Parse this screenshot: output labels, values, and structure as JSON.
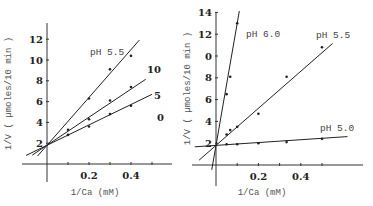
{
  "chart_data": [
    {
      "type": "scatter",
      "subtype": "lineweaver-burk",
      "title": "pH 5.5",
      "xlabel": "1/Ca (mM)",
      "ylabel": "1/V ( µmoles/10 min )",
      "xlim": [
        -0.1,
        0.55
      ],
      "ylim": [
        -1.8,
        13.5
      ],
      "xticks": [
        0.1,
        0.2,
        0.3,
        0.4,
        0.5
      ],
      "xtick_labels": [
        "",
        "0.2",
        "",
        "0.4",
        ""
      ],
      "yticks": [
        2,
        4,
        6,
        8,
        10,
        12
      ],
      "ytick_labels": [
        "2",
        "4",
        "6",
        "8",
        "10",
        "12"
      ],
      "grid": false,
      "series": [
        {
          "name": "10",
          "label": "10",
          "intercept": 1.8,
          "slope": 23.0,
          "x_line": [
            -0.045,
            0.44
          ],
          "points": [
            [
              0.1,
              3.3
            ],
            [
              0.2,
              6.3
            ],
            [
              0.3,
              9.1
            ],
            [
              0.4,
              10.4
            ]
          ]
        },
        {
          "name": "5",
          "label": "5",
          "intercept": 1.8,
          "slope": 13.5,
          "x_line": [
            -0.07,
            0.47
          ],
          "points": [
            [
              0.2,
              4.3
            ],
            [
              0.3,
              6.1
            ],
            [
              0.4,
              7.4
            ]
          ]
        },
        {
          "name": "0",
          "label": "0",
          "intercept": 1.8,
          "slope": 9.8,
          "x_line": [
            -0.1,
            0.5
          ],
          "points": [
            [
              0.1,
              2.8
            ],
            [
              0.2,
              3.6
            ],
            [
              0.3,
              4.8
            ],
            [
              0.4,
              5.6
            ]
          ]
        }
      ]
    },
    {
      "type": "scatter",
      "subtype": "lineweaver-burk",
      "title": "",
      "xlabel": "1/Ca (mM)",
      "ylabel": "1/V ( µmoles/10 min )",
      "xlim": [
        -0.1,
        0.68
      ],
      "ylim": [
        -2,
        14.5
      ],
      "xticks": [
        0.1,
        0.2,
        0.3,
        0.4,
        0.5
      ],
      "xtick_labels": [
        "",
        "0.2",
        "",
        "0.4",
        ""
      ],
      "yticks": [
        2,
        4,
        6,
        8,
        10,
        12,
        14
      ],
      "ytick_labels": [
        "2",
        "4",
        "6",
        "8",
        "0",
        "12",
        "14"
      ],
      "grid": false,
      "series": [
        {
          "name": "pH 6.0",
          "label": "pH 6.0",
          "intercept": 1.8,
          "slope": 112.0,
          "x_line": [
            -0.02,
            0.11
          ],
          "points": [
            [
              0.05,
              6.5
            ],
            [
              0.067,
              8.1
            ],
            [
              0.1,
              13.0
            ]
          ]
        },
        {
          "name": "pH 5.5",
          "label": "pH 5.5",
          "intercept": 1.8,
          "slope": 17.0,
          "x_line": [
            -0.08,
            0.55
          ],
          "points": [
            [
              0.05,
              2.8
            ],
            [
              0.067,
              3.2
            ],
            [
              0.1,
              3.5
            ],
            [
              0.2,
              4.7
            ],
            [
              0.333,
              8.1
            ],
            [
              0.5,
              10.8
            ]
          ]
        },
        {
          "name": "pH 5.0",
          "label": "pH 5.0",
          "intercept": 1.8,
          "slope": 1.3,
          "x_line": [
            -0.1,
            0.62
          ],
          "points": [
            [
              0.05,
              1.9
            ],
            [
              0.1,
              1.9
            ],
            [
              0.2,
              2.0
            ],
            [
              0.333,
              2.1
            ],
            [
              0.5,
              2.4
            ]
          ]
        }
      ]
    }
  ]
}
